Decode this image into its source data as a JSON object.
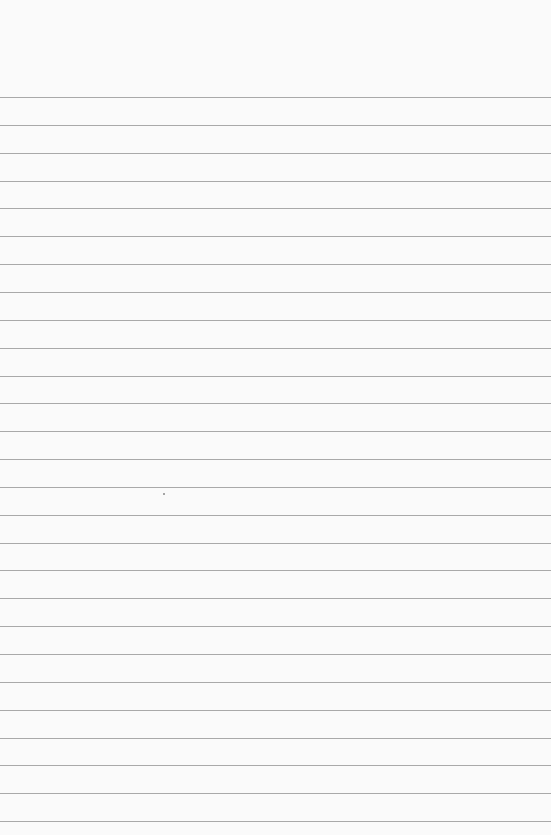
{
  "paper": {
    "type": "lined-paper",
    "background_color": "#fafafa",
    "line_color": "#9a9a9a",
    "first_line_y": 97,
    "line_spacing": 27.85,
    "line_count": 27,
    "text": ""
  }
}
